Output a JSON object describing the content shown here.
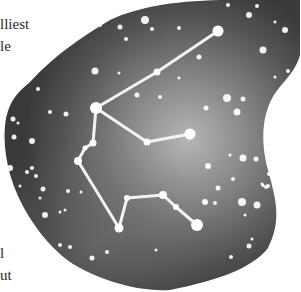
{
  "text_fragments": [
    {
      "text": "lliest",
      "x": 0,
      "y": 17
    },
    {
      "text": "le",
      "x": 0,
      "y": 39
    },
    {
      "text": "l",
      "x": 0,
      "y": 246
    },
    {
      "text": "ut",
      "x": 0,
      "y": 268
    }
  ],
  "illustration": {
    "subject": "constellation-aquarius-watercolor",
    "colors": {
      "sky_dark": "#3c3c3c",
      "sky_mid": "#5e5e5e",
      "sky_light": "#a8a8a8",
      "star": "#ffffff",
      "line": "#f2f2f2"
    },
    "constellation_stars": [
      {
        "x": 218,
        "y": 31,
        "r": 5.5
      },
      {
        "x": 157,
        "y": 72,
        "r": 3.5
      },
      {
        "x": 96,
        "y": 108,
        "r": 6
      },
      {
        "x": 93,
        "y": 143,
        "r": 3.5
      },
      {
        "x": 85,
        "y": 148,
        "r": 2.5
      },
      {
        "x": 78,
        "y": 161,
        "r": 4
      },
      {
        "x": 147,
        "y": 142,
        "r": 3.5
      },
      {
        "x": 190,
        "y": 134,
        "r": 5.5
      },
      {
        "x": 119,
        "y": 228,
        "r": 4.5
      },
      {
        "x": 127,
        "y": 198,
        "r": 3
      },
      {
        "x": 163,
        "y": 195,
        "r": 4
      },
      {
        "x": 176,
        "y": 207,
        "r": 3
      },
      {
        "x": 197,
        "y": 225,
        "r": 6
      }
    ],
    "constellation_lines": [
      [
        218,
        31,
        157,
        72
      ],
      [
        157,
        72,
        96,
        108
      ],
      [
        96,
        108,
        93,
        143
      ],
      [
        93,
        143,
        85,
        148
      ],
      [
        85,
        148,
        78,
        161
      ],
      [
        96,
        108,
        147,
        142
      ],
      [
        147,
        142,
        190,
        134
      ],
      [
        78,
        161,
        119,
        228
      ],
      [
        119,
        228,
        127,
        198
      ],
      [
        127,
        198,
        163,
        195
      ],
      [
        163,
        195,
        176,
        207
      ],
      [
        176,
        207,
        197,
        225
      ]
    ],
    "background_stars": [
      {
        "x": 145,
        "y": 20,
        "r": 4
      },
      {
        "x": 152,
        "y": 29,
        "r": 2
      },
      {
        "x": 179,
        "y": 78,
        "r": 1.5
      },
      {
        "x": 120,
        "y": 27,
        "r": 2.5
      },
      {
        "x": 126,
        "y": 39,
        "r": 2
      },
      {
        "x": 100,
        "y": 25,
        "r": 2
      },
      {
        "x": 179,
        "y": 28,
        "r": 2
      },
      {
        "x": 199,
        "y": 57,
        "r": 2.5
      },
      {
        "x": 228,
        "y": 5,
        "r": 2
      },
      {
        "x": 249,
        "y": 15,
        "r": 3
      },
      {
        "x": 257,
        "y": 6,
        "r": 2
      },
      {
        "x": 285,
        "y": 30,
        "r": 3
      },
      {
        "x": 263,
        "y": 50,
        "r": 3.5
      },
      {
        "x": 288,
        "y": 71,
        "r": 2
      },
      {
        "x": 275,
        "y": 77,
        "r": 1.5
      },
      {
        "x": 281,
        "y": 89,
        "r": 2
      },
      {
        "x": 227,
        "y": 98,
        "r": 4
      },
      {
        "x": 243,
        "y": 99,
        "r": 2.5
      },
      {
        "x": 237,
        "y": 112,
        "r": 3.5
      },
      {
        "x": 206,
        "y": 108,
        "r": 2.5
      },
      {
        "x": 269,
        "y": 122,
        "r": 2.5
      },
      {
        "x": 267,
        "y": 137,
        "r": 2
      },
      {
        "x": 95,
        "y": 71,
        "r": 3.5
      },
      {
        "x": 119,
        "y": 73,
        "r": 1.5
      },
      {
        "x": 137,
        "y": 95,
        "r": 2.5
      },
      {
        "x": 160,
        "y": 97,
        "r": 2
      },
      {
        "x": 38,
        "y": 89,
        "r": 2
      },
      {
        "x": 50,
        "y": 112,
        "r": 2
      },
      {
        "x": 66,
        "y": 114,
        "r": 2.5
      },
      {
        "x": 13,
        "y": 119,
        "r": 2.5
      },
      {
        "x": 18,
        "y": 123,
        "r": 1.5
      },
      {
        "x": 14,
        "y": 137,
        "r": 2.5
      },
      {
        "x": 32,
        "y": 141,
        "r": 3
      },
      {
        "x": 10,
        "y": 168,
        "r": 3
      },
      {
        "x": 27,
        "y": 172,
        "r": 2
      },
      {
        "x": 32,
        "y": 168,
        "r": 2
      },
      {
        "x": 36,
        "y": 176,
        "r": 2
      },
      {
        "x": 20,
        "y": 186,
        "r": 1.5
      },
      {
        "x": 43,
        "y": 189,
        "r": 2.5
      },
      {
        "x": 40,
        "y": 198,
        "r": 1.5
      },
      {
        "x": 68,
        "y": 191,
        "r": 2
      },
      {
        "x": 81,
        "y": 192,
        "r": 1.5
      },
      {
        "x": 45,
        "y": 215,
        "r": 3
      },
      {
        "x": 60,
        "y": 212,
        "r": 1.5
      },
      {
        "x": 65,
        "y": 210,
        "r": 1.5
      },
      {
        "x": 60,
        "y": 245,
        "r": 2
      },
      {
        "x": 70,
        "y": 247,
        "r": 2
      },
      {
        "x": 92,
        "y": 258,
        "r": 2.5
      },
      {
        "x": 107,
        "y": 252,
        "r": 2
      },
      {
        "x": 156,
        "y": 250,
        "r": 1.5
      },
      {
        "x": 230,
        "y": 155,
        "r": 1.5
      },
      {
        "x": 243,
        "y": 158,
        "r": 3.5
      },
      {
        "x": 256,
        "y": 159,
        "r": 2.5
      },
      {
        "x": 208,
        "y": 166,
        "r": 3
      },
      {
        "x": 218,
        "y": 188,
        "r": 2.5
      },
      {
        "x": 205,
        "y": 202,
        "r": 3
      },
      {
        "x": 215,
        "y": 203,
        "r": 2
      },
      {
        "x": 242,
        "y": 202,
        "r": 4
      },
      {
        "x": 257,
        "y": 205,
        "r": 3.5
      },
      {
        "x": 245,
        "y": 215,
        "r": 1.5
      },
      {
        "x": 269,
        "y": 174,
        "r": 2
      },
      {
        "x": 268,
        "y": 186,
        "r": 2
      },
      {
        "x": 263,
        "y": 185,
        "r": 1.5
      },
      {
        "x": 263,
        "y": 186,
        "r": 1
      },
      {
        "x": 263,
        "y": 186,
        "r": 1
      },
      {
        "x": 280,
        "y": 181,
        "r": 2
      },
      {
        "x": 277,
        "y": 185,
        "r": 1.5
      },
      {
        "x": 262,
        "y": 184,
        "r": 1.5
      },
      {
        "x": 249,
        "y": 246,
        "r": 2.5
      },
      {
        "x": 266,
        "y": 187,
        "r": 2
      },
      {
        "x": 275,
        "y": 22,
        "r": 1.5
      },
      {
        "x": 252,
        "y": 239,
        "r": 1.5
      },
      {
        "x": 231,
        "y": 257,
        "r": 2
      },
      {
        "x": 282,
        "y": 197,
        "r": 1.5
      },
      {
        "x": 233,
        "y": 179,
        "r": 2
      }
    ]
  }
}
